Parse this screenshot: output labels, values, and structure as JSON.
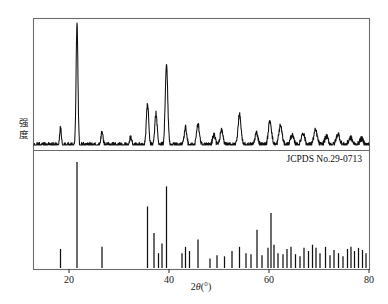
{
  "figure": {
    "kind": "xrd-pattern",
    "background_color": "#ffffff",
    "frame_color": "#6b6b6b",
    "trace_color": "#101010"
  },
  "axis": {
    "x_title_prefix": "2",
    "x_title_theta": "θ",
    "x_title_unit": "(°)",
    "x_title_full": "2θ(°)",
    "x_ticks": [
      20,
      40,
      60,
      80
    ],
    "x_tick_labels": [
      "20",
      "40",
      "60",
      "80"
    ],
    "x_min": 13,
    "x_max": 80,
    "y_label": "强度",
    "y_label_chars": [
      "强",
      "度"
    ],
    "y_ticks_shown": false
  },
  "annotations": {
    "reference_card": "JCPDS No.29-0713"
  },
  "chart_data": {
    "type": "line",
    "title": "",
    "subtitle": "",
    "xlabel": "2θ(°)",
    "ylabel": "强度",
    "xlim": [
      13,
      80
    ],
    "ylim": [
      0,
      100
    ],
    "grid": false,
    "legend": "none",
    "panels": [
      {
        "name": "measured-pattern",
        "type": "line",
        "description": "Measured XRD diffractogram of sample",
        "peaks": [
          {
            "two_theta": 18.3,
            "intensity": 14
          },
          {
            "two_theta": 21.6,
            "intensity": 100
          },
          {
            "two_theta": 26.6,
            "intensity": 11
          },
          {
            "two_theta": 32.3,
            "intensity": 6
          },
          {
            "two_theta": 35.7,
            "intensity": 34
          },
          {
            "two_theta": 37.4,
            "intensity": 26
          },
          {
            "two_theta": 39.5,
            "intensity": 66
          },
          {
            "two_theta": 43.3,
            "intensity": 15
          },
          {
            "two_theta": 45.8,
            "intensity": 17
          },
          {
            "two_theta": 49.0,
            "intensity": 9
          },
          {
            "two_theta": 50.5,
            "intensity": 12
          },
          {
            "two_theta": 54.1,
            "intensity": 25
          },
          {
            "two_theta": 57.5,
            "intensity": 10
          },
          {
            "two_theta": 60.2,
            "intensity": 20
          },
          {
            "two_theta": 62.3,
            "intensity": 16
          },
          {
            "two_theta": 64.6,
            "intensity": 8
          },
          {
            "two_theta": 66.8,
            "intensity": 10
          },
          {
            "two_theta": 69.3,
            "intensity": 12
          },
          {
            "two_theta": 71.5,
            "intensity": 7
          },
          {
            "two_theta": 73.8,
            "intensity": 9
          },
          {
            "two_theta": 76.3,
            "intensity": 6
          },
          {
            "two_theta": 78.5,
            "intensity": 5
          }
        ],
        "baseline_noise": 2.2
      },
      {
        "name": "jcpds-reference-sticks",
        "type": "bar",
        "description": "JCPDS No.29-0713 reference stick pattern",
        "sticks": [
          {
            "two_theta": 18.3,
            "intensity": 18
          },
          {
            "two_theta": 21.6,
            "intensity": 100
          },
          {
            "two_theta": 26.6,
            "intensity": 20
          },
          {
            "two_theta": 35.7,
            "intensity": 58
          },
          {
            "two_theta": 37.0,
            "intensity": 33
          },
          {
            "two_theta": 37.9,
            "intensity": 14
          },
          {
            "two_theta": 38.6,
            "intensity": 23
          },
          {
            "two_theta": 39.5,
            "intensity": 77
          },
          {
            "two_theta": 42.6,
            "intensity": 14
          },
          {
            "two_theta": 43.3,
            "intensity": 20
          },
          {
            "two_theta": 44.1,
            "intensity": 16
          },
          {
            "two_theta": 45.8,
            "intensity": 27
          },
          {
            "two_theta": 48.2,
            "intensity": 9
          },
          {
            "two_theta": 49.6,
            "intensity": 12
          },
          {
            "two_theta": 51.1,
            "intensity": 11
          },
          {
            "two_theta": 52.6,
            "intensity": 16
          },
          {
            "two_theta": 54.1,
            "intensity": 20
          },
          {
            "two_theta": 55.4,
            "intensity": 14
          },
          {
            "two_theta": 56.4,
            "intensity": 13
          },
          {
            "two_theta": 57.6,
            "intensity": 36
          },
          {
            "two_theta": 58.6,
            "intensity": 12
          },
          {
            "two_theta": 59.8,
            "intensity": 19
          },
          {
            "two_theta": 60.4,
            "intensity": 52
          },
          {
            "two_theta": 61.0,
            "intensity": 22
          },
          {
            "two_theta": 61.8,
            "intensity": 14
          },
          {
            "two_theta": 62.8,
            "intensity": 13
          },
          {
            "two_theta": 63.6,
            "intensity": 18
          },
          {
            "two_theta": 64.4,
            "intensity": 20
          },
          {
            "two_theta": 65.3,
            "intensity": 13
          },
          {
            "two_theta": 66.2,
            "intensity": 11
          },
          {
            "two_theta": 67.0,
            "intensity": 19
          },
          {
            "two_theta": 67.9,
            "intensity": 16
          },
          {
            "two_theta": 68.7,
            "intensity": 22
          },
          {
            "two_theta": 69.4,
            "intensity": 19
          },
          {
            "two_theta": 70.2,
            "intensity": 14
          },
          {
            "two_theta": 71.3,
            "intensity": 20
          },
          {
            "two_theta": 72.2,
            "intensity": 12
          },
          {
            "two_theta": 73.0,
            "intensity": 17
          },
          {
            "two_theta": 73.9,
            "intensity": 14
          },
          {
            "two_theta": 74.8,
            "intensity": 11
          },
          {
            "two_theta": 75.7,
            "intensity": 18
          },
          {
            "two_theta": 76.4,
            "intensity": 20
          },
          {
            "two_theta": 77.1,
            "intensity": 16
          },
          {
            "two_theta": 77.9,
            "intensity": 19
          },
          {
            "two_theta": 78.7,
            "intensity": 17
          },
          {
            "two_theta": 79.4,
            "intensity": 14
          }
        ]
      }
    ]
  }
}
